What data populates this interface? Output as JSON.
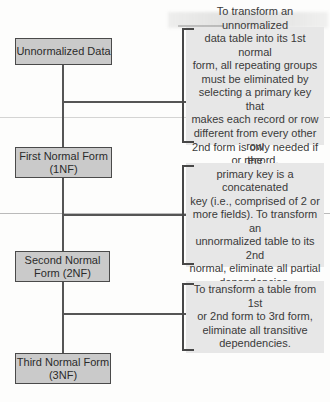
{
  "flowchart": {
    "boxes": [
      {
        "id": "unnormalized",
        "label": "Unnormalized Data"
      },
      {
        "id": "1nf",
        "label": "First Normal Form\n(1NF)"
      },
      {
        "id": "2nf",
        "label": "Second Normal\nForm (2NF)"
      },
      {
        "id": "3nf",
        "label": "Third Normal Form\n(3NF)"
      }
    ],
    "callouts": [
      {
        "for": "1nf",
        "text": "To transform an unnormalized\ndata table into its 1st normal\nform, all repeating groups\nmust be eliminated by\nselecting a primary key that\nmakes each record or row\ndifferent from every other row\nor record."
      },
      {
        "for": "2nf",
        "text": "2nd form is only needed if the\nprimary key is a concatenated\nkey (i.e., comprised of 2 or\nmore fields). To transform an\nunnormalized table to its 2nd\nnormal, eliminate all partial\ndependencies."
      },
      {
        "for": "3nf",
        "text": "To transform a table from 1st\nor 2nd form to 3rd form,\neliminate all transitive\ndependencies."
      }
    ],
    "colors": {
      "box_fill": "#cacaca",
      "box_border": "#4a4a4a",
      "callout_fill": "#e7e7e7",
      "callout_text": "#3a3a3a",
      "bracket": "#474747",
      "line": "#555555",
      "text": "#2b2b2b"
    }
  }
}
